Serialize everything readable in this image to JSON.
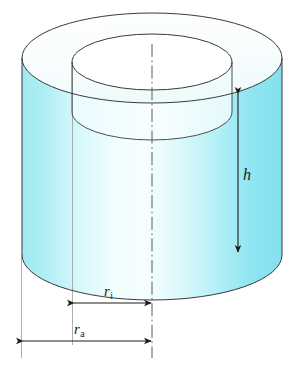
{
  "figure": {
    "shape": "hollow-cylinder",
    "background_color": "#ffffff",
    "outline_color": "#3a3a3a",
    "axis_line_color": "#5a5a5a",
    "projection_line_color": "#8a8a8a",
    "arrow_color": "#1d1d1d",
    "surface_colors": {
      "wall_left": "#a8ecf2",
      "wall_highlight": "#f2fdfd",
      "wall_right": "#87e2f0",
      "top_face": "#fbfdfc",
      "top_face_shadow": "#eefbfb"
    }
  },
  "geometry": {
    "canvas_width": 296,
    "canvas_height": 369,
    "outer_ellipse": {
      "cx": 152,
      "cy": 58,
      "rx": 130,
      "ry": 45
    },
    "inner_ellipse": {
      "cx": 152,
      "cy": 62,
      "rx": 80,
      "ry": 28
    },
    "bottom_ellipse": {
      "cx": 152,
      "cy": 255,
      "rx": 130,
      "ry": 45
    },
    "body_height_px": 197,
    "center_axis_x": 152,
    "inner_left_x": 73,
    "outer_left_x": 21
  },
  "dimensions": [
    {
      "id": "h",
      "symbol": "h",
      "subscript": "",
      "meaning": "height",
      "orientation": "vertical",
      "arrow": {
        "x1": 238,
        "y1": 93,
        "x2": 238,
        "y2": 253
      },
      "double_headed": true
    },
    {
      "id": "ri",
      "symbol": "r",
      "subscript": "i",
      "meaning": "inner radius",
      "orientation": "horizontal",
      "arrow": {
        "x1": 73,
        "y1": 303,
        "x2": 152,
        "y2": 303
      },
      "double_headed": true
    },
    {
      "id": "ra",
      "symbol": "r",
      "subscript": "a",
      "meaning": "outer radius",
      "orientation": "horizontal",
      "arrow": {
        "x1": 21,
        "y1": 341,
        "x2": 152,
        "y2": 341
      },
      "double_headed": true
    }
  ],
  "labels": {
    "height": {
      "text": "h",
      "sub": ""
    },
    "inner_radius": {
      "text": "r",
      "sub": "i"
    },
    "outer_radius": {
      "text": "r",
      "sub": "a"
    }
  }
}
